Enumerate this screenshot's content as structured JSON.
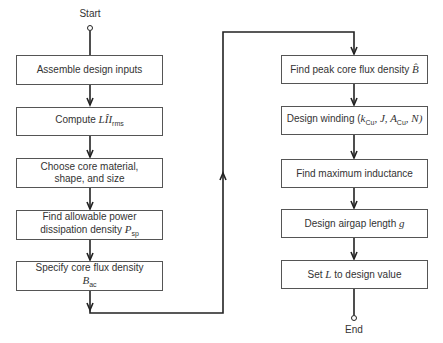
{
  "terminals": {
    "start": "Start",
    "end": "End"
  },
  "left_column": [
    {
      "line1": "Assemble design inputs",
      "line2": ""
    },
    {
      "line1": "Compute ",
      "math": "LÎI",
      "sub": "rms"
    },
    {
      "line1": "Choose core material,",
      "line2": "shape, and size"
    },
    {
      "line1": "Find allowable power",
      "line2": "dissipation density ",
      "math": "P",
      "sub": "sp"
    },
    {
      "line1": "Specify core flux density",
      "math": "B",
      "sub": "ac"
    }
  ],
  "right_column": [
    {
      "line1": "Find peak core flux density ",
      "math": "B̂"
    },
    {
      "line1": "Design winding (",
      "math1": "k",
      "sub1": "Cu",
      "rest": ", J, A",
      "sub2": "Cu",
      "rest2": ", N)"
    },
    {
      "line1": "Find maximum inductance"
    },
    {
      "line1": "Design airgap length ",
      "math": "g"
    },
    {
      "line1": "Set ",
      "math": "L",
      "line2": " to design value"
    }
  ],
  "colors": {
    "line": "#222222",
    "box_border": "#555555",
    "text": "#333333"
  }
}
